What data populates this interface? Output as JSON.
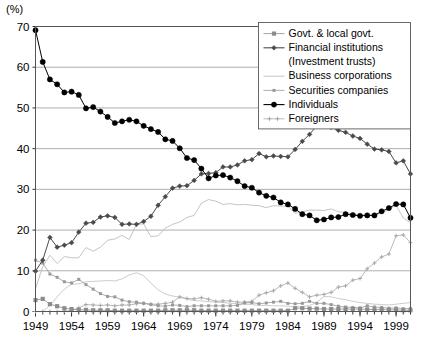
{
  "unit_label": "(%)",
  "chart_data": {
    "type": "line",
    "title": "",
    "subtitle": "",
    "xlabel": "",
    "ylabel": "(%)",
    "ylim": [
      0,
      70
    ],
    "xlim": [
      1949,
      2002
    ],
    "grid": true,
    "legend_position": "top-right",
    "yticks": [
      0,
      10,
      20,
      30,
      40,
      50,
      60,
      70
    ],
    "xticks": [
      1949,
      1954,
      1959,
      1964,
      1969,
      1974,
      1979,
      1984,
      1989,
      1994,
      1999
    ],
    "x": [
      1949,
      1950,
      1951,
      1952,
      1953,
      1954,
      1955,
      1956,
      1957,
      1958,
      1959,
      1960,
      1961,
      1962,
      1963,
      1964,
      1965,
      1966,
      1967,
      1968,
      1969,
      1970,
      1971,
      1972,
      1973,
      1974,
      1975,
      1976,
      1977,
      1978,
      1979,
      1980,
      1981,
      1982,
      1983,
      1984,
      1985,
      1986,
      1987,
      1988,
      1989,
      1990,
      1991,
      1992,
      1993,
      1994,
      1995,
      1996,
      1997,
      1998,
      1999,
      2000,
      2001
    ],
    "series": [
      {
        "name": "Govt. & local govt.",
        "marker": "square",
        "color": "#8c8c8c",
        "values": [
          2.8,
          3.1,
          1.8,
          1.3,
          0.8,
          0.6,
          0.4,
          0.4,
          0.3,
          0.3,
          0.3,
          0.2,
          0.2,
          0.2,
          0.2,
          0.2,
          0.2,
          0.2,
          0.3,
          0.3,
          0.3,
          0.3,
          0.3,
          0.2,
          0.2,
          0.2,
          0.2,
          0.2,
          0.2,
          0.2,
          0.2,
          0.2,
          0.2,
          0.2,
          0.2,
          0.2,
          0.8,
          0.8,
          0.7,
          0.7,
          0.6,
          0.6,
          0.6,
          0.6,
          0.6,
          0.6,
          0.5,
          0.5,
          0.5,
          0.4,
          0.4,
          0.3,
          0.3
        ]
      },
      {
        "name": "Financial institutions",
        "marker": "diamond",
        "color": "#4a4a4a",
        "values": [
          9.9,
          12.6,
          18.2,
          15.8,
          16.3,
          16.9,
          19.5,
          21.7,
          21.9,
          23.2,
          23.5,
          23.1,
          21.4,
          21.5,
          21.4,
          22.1,
          23.4,
          26.1,
          28.2,
          30.3,
          30.8,
          30.9,
          32.2,
          33.8,
          33.9,
          34.1,
          35.5,
          35.5,
          36.0,
          37.0,
          37.3,
          38.8,
          38.0,
          38.2,
          38.1,
          38.0,
          39.8,
          41.8,
          43.5,
          45.6,
          46.0,
          45.2,
          44.5,
          44.0,
          43.1,
          42.5,
          41.1,
          39.9,
          39.7,
          39.3,
          36.5,
          37.0,
          33.8
        ]
      },
      {
        "name": "(Investment trusts)",
        "marker": "none",
        "color": "#bfbfbf",
        "values": [
          0.0,
          0.0,
          1.5,
          3.6,
          5.5,
          6.7,
          6.8,
          7.3,
          7.4,
          7.5,
          7.6,
          7.5,
          8.0,
          9.0,
          9.5,
          8.8,
          7.0,
          5.3,
          4.3,
          3.8,
          3.5,
          3.0,
          2.7,
          2.6,
          2.4,
          2.3,
          2.2,
          2.0,
          1.9,
          1.8,
          1.7,
          1.5,
          1.5,
          1.4,
          1.4,
          1.3,
          1.2,
          1.2,
          1.5,
          2.2,
          3.7,
          3.6,
          3.2,
          2.9,
          2.5,
          2.2,
          2.0,
          1.8,
          1.7,
          1.6,
          1.8,
          2.0,
          2.2
        ]
      },
      {
        "name": "Business corporations",
        "marker": "none",
        "color": "#b5b5b5",
        "values": [
          5.6,
          11.0,
          13.8,
          11.8,
          13.5,
          13.2,
          13.2,
          15.7,
          14.8,
          15.8,
          17.5,
          17.8,
          18.7,
          17.7,
          21.4,
          21.5,
          18.4,
          18.6,
          20.5,
          21.4,
          22.0,
          23.1,
          23.6,
          26.6,
          27.5,
          27.1,
          26.3,
          26.5,
          26.2,
          26.3,
          26.1,
          26.0,
          25.5,
          26.0,
          25.9,
          25.9,
          24.1,
          24.5,
          24.9,
          24.9,
          24.8,
          25.2,
          24.5,
          24.4,
          23.9,
          23.8,
          23.6,
          23.8,
          24.1,
          25.2,
          26.0,
          23.0,
          21.8
        ]
      },
      {
        "name": "Securities companies",
        "marker": "small-square",
        "color": "#999999",
        "values": [
          12.6,
          11.9,
          9.2,
          8.4,
          7.3,
          7.0,
          7.9,
          6.6,
          5.5,
          4.4,
          3.7,
          3.6,
          2.8,
          2.4,
          2.3,
          2.0,
          1.7,
          1.4,
          1.3,
          1.6,
          1.5,
          1.2,
          1.4,
          1.4,
          1.4,
          1.4,
          1.4,
          1.4,
          1.5,
          2.1,
          2.2,
          1.9,
          2.1,
          2.3,
          2.5,
          2.0,
          1.9,
          2.0,
          2.5,
          2.0,
          2.0,
          1.7,
          1.3,
          1.1,
          1.0,
          0.9,
          1.4,
          1.1,
          1.0,
          0.8,
          0.9,
          0.7,
          0.7
        ]
      },
      {
        "name": "Individuals",
        "marker": "circle",
        "color": "#000000",
        "values": [
          69.1,
          61.3,
          57.0,
          55.8,
          53.8,
          54.0,
          53.2,
          49.9,
          50.2,
          49.1,
          47.8,
          46.3,
          46.7,
          47.1,
          46.7,
          45.6,
          44.8,
          44.1,
          42.3,
          41.9,
          40.1,
          37.7,
          37.2,
          35.1,
          32.7,
          33.4,
          33.5,
          32.9,
          32.0,
          30.8,
          30.4,
          29.2,
          28.4,
          28.0,
          26.8,
          26.3,
          25.2,
          23.9,
          23.6,
          22.4,
          22.6,
          23.1,
          23.2,
          23.9,
          23.7,
          23.5,
          23.6,
          23.6,
          24.6,
          25.4,
          26.4,
          26.3,
          23.0
        ]
      },
      {
        "name": "Foreigners",
        "marker": "cross",
        "color": "#a8a8a8",
        "values": [
          0.0,
          0.0,
          0.0,
          0.0,
          0.1,
          0.2,
          0.9,
          1.7,
          1.6,
          1.5,
          1.6,
          1.4,
          1.6,
          1.6,
          1.9,
          2.0,
          1.8,
          1.8,
          2.0,
          2.3,
          3.6,
          3.2,
          3.1,
          3.4,
          3.0,
          2.5,
          2.6,
          2.6,
          2.3,
          2.3,
          2.5,
          4.0,
          4.6,
          5.1,
          6.3,
          7.0,
          5.7,
          4.7,
          3.6,
          4.0,
          4.2,
          4.7,
          6.0,
          6.3,
          7.7,
          8.1,
          10.5,
          11.9,
          13.4,
          14.1,
          18.6,
          18.8,
          16.9
        ]
      }
    ]
  },
  "legend": {
    "items": [
      {
        "label": "Govt. & local govt.",
        "marker": "square",
        "color": "#8c8c8c"
      },
      {
        "label": "Financial institutions",
        "marker": "diamond",
        "color": "#4a4a4a"
      },
      {
        "label": "(Investment trusts)",
        "marker": "none",
        "color": "#bfbfbf"
      },
      {
        "label": "Business corporations",
        "marker": "none",
        "color": "#b5b5b5"
      },
      {
        "label": "Securities companies",
        "marker": "small-square",
        "color": "#999999"
      },
      {
        "label": "Individuals",
        "marker": "circle",
        "color": "#000000"
      },
      {
        "label": "Foreigners",
        "marker": "cross",
        "color": "#a8a8a8"
      }
    ]
  }
}
